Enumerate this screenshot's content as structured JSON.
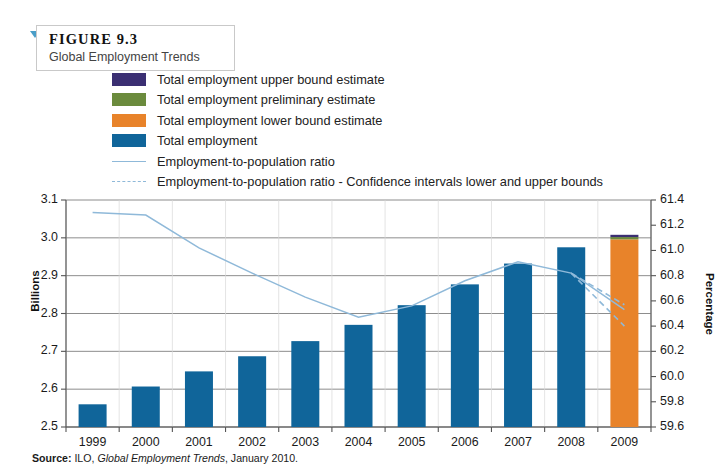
{
  "figure": {
    "label": "FIGURE 9.3",
    "subtitle": "Global Employment Trends"
  },
  "source": {
    "label": "Source:",
    "publisher": "ILO,",
    "title": "Global Employment Trends",
    "date": ", January 2010."
  },
  "colors": {
    "upper_bound": "#3b2f72",
    "preliminary": "#6b8b3d",
    "lower_bound": "#e8832a",
    "total_employment": "#10659a",
    "ratio_line": "#8fb9d9",
    "gridline": "#808080",
    "axis": "#555555"
  },
  "legend": [
    {
      "name": "upper-bound",
      "type": "swatch",
      "color": "#3b2f72",
      "label": "Total employment upper bound estimate"
    },
    {
      "name": "preliminary",
      "type": "swatch",
      "color": "#6b8b3d",
      "label": "Total employment preliminary estimate"
    },
    {
      "name": "lower-bound",
      "type": "swatch",
      "color": "#e8832a",
      "label": "Total employment lower bound estimate"
    },
    {
      "name": "total-employment",
      "type": "swatch",
      "color": "#10659a",
      "label": "Total employment"
    },
    {
      "name": "ratio-line",
      "type": "line",
      "color": "#8fb9d9",
      "label": "Employment-to-population ratio"
    },
    {
      "name": "ratio-ci",
      "type": "dashed",
      "color": "#8fb9d9",
      "label": "Employment-to-population ratio - Confidence intervals lower and upper bounds"
    }
  ],
  "chart_data": {
    "type": "bar",
    "title": "Global Employment Trends",
    "xlabel": "",
    "ylabel": "Billions",
    "y2label": "Percentage",
    "ylim": [
      2.5,
      3.1
    ],
    "y2lim": [
      59.6,
      61.4
    ],
    "grid": true,
    "legend_position": "top",
    "categories": [
      "1999",
      "2000",
      "2001",
      "2002",
      "2003",
      "2004",
      "2005",
      "2006",
      "2007",
      "2008",
      "2009"
    ],
    "yticks": [
      "2.5",
      "2.6",
      "2.7",
      "2.8",
      "2.9",
      "3.0",
      "3.1"
    ],
    "y2ticks": [
      "59.6",
      "59.8",
      "60.0",
      "60.2",
      "60.4",
      "60.6",
      "60.8",
      "61.0",
      "61.2",
      "61.4"
    ],
    "series": [
      {
        "name": "Total employment",
        "axis": "left",
        "type": "bar",
        "color": "#10659a",
        "values": [
          2.56,
          2.607,
          2.647,
          2.687,
          2.727,
          2.77,
          2.822,
          2.877,
          2.932,
          2.975,
          null
        ]
      },
      {
        "name": "Total employment lower bound estimate",
        "axis": "left",
        "type": "bar",
        "color": "#e8832a",
        "values": [
          null,
          null,
          null,
          null,
          null,
          null,
          null,
          null,
          null,
          null,
          2.996
        ]
      },
      {
        "name": "Total employment preliminary estimate",
        "axis": "left",
        "type": "bar",
        "color": "#6b8b3d",
        "values": [
          null,
          null,
          null,
          null,
          null,
          null,
          null,
          null,
          null,
          null,
          3.002
        ]
      },
      {
        "name": "Total employment upper bound estimate",
        "axis": "left",
        "type": "bar",
        "color": "#3b2f72",
        "values": [
          null,
          null,
          null,
          null,
          null,
          null,
          null,
          null,
          null,
          null,
          3.008
        ]
      },
      {
        "name": "Employment-to-population ratio",
        "axis": "right",
        "type": "line",
        "color": "#8fb9d9",
        "values": [
          61.3,
          61.28,
          61.02,
          60.82,
          60.63,
          60.47,
          60.56,
          60.76,
          60.91,
          60.82,
          60.53
        ]
      },
      {
        "name": "Employment-to-population ratio - Confidence intervals upper bound",
        "axis": "right",
        "type": "dashed",
        "color": "#8fb9d9",
        "values": [
          null,
          null,
          null,
          null,
          null,
          null,
          null,
          null,
          null,
          60.82,
          60.57
        ]
      },
      {
        "name": "Employment-to-population ratio - Confidence intervals lower bound",
        "axis": "right",
        "type": "dashed",
        "color": "#8fb9d9",
        "values": [
          null,
          null,
          null,
          null,
          null,
          null,
          null,
          null,
          null,
          60.82,
          60.4
        ]
      }
    ]
  }
}
